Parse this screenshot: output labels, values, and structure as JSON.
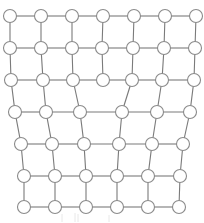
{
  "diagram": {
    "type": "grid-graph",
    "colors": {
      "edge": "#7a7a7a",
      "node_fill": "#ffffff",
      "node_stroke": "#8a8a8a",
      "background": "#ffffff"
    },
    "rows": [
      {
        "id": "r0",
        "node_count": 7
      },
      {
        "id": "r1",
        "node_count": 7
      },
      {
        "id": "r2",
        "node_count": 7
      },
      {
        "id": "r3",
        "node_count": 6
      },
      {
        "id": "r4",
        "node_count": 6
      },
      {
        "id": "r5",
        "node_count": 6
      },
      {
        "id": "r6",
        "node_count": 6
      }
    ],
    "edges": {
      "horizontal": "each node connects to its right neighbor within the same row",
      "vertical_same_count": "node i connects to node i in next row",
      "transition_r2_r3": [
        [
          0,
          0
        ],
        [
          1,
          1
        ],
        [
          2,
          2
        ],
        [
          4,
          3
        ],
        [
          5,
          4
        ],
        [
          6,
          5
        ]
      ]
    }
  }
}
